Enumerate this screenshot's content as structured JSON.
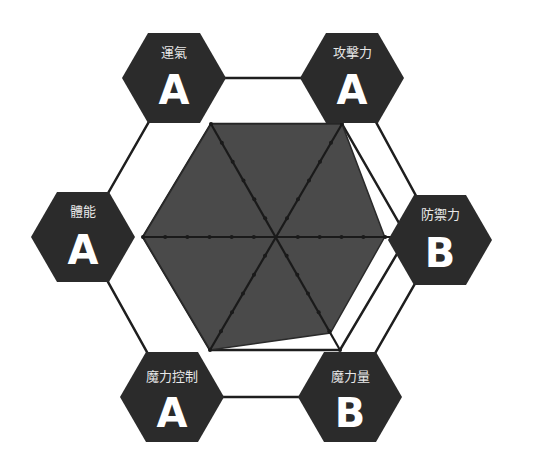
{
  "chart_data": {
    "type": "radar",
    "title": "",
    "axes": [
      "運氣",
      "攻擊力",
      "防禦力",
      "魔力量",
      "魔力控制",
      "體能"
    ],
    "grades": [
      "A",
      "A",
      "B",
      "B",
      "A",
      "A"
    ],
    "values": [
      100,
      100,
      83,
      85,
      100,
      100
    ],
    "scale": {
      "min": 0,
      "max": 100,
      "ticks_per_axis": 6
    },
    "grid": "hexagon",
    "legend": "none"
  },
  "colors": {
    "background": "#ffffff",
    "badge_fill": "#2b2b2b",
    "area_fill": "#4a4a4a",
    "line": "#1e1e1e",
    "badge_text": "#ffffff"
  },
  "badges": [
    {
      "label": "運氣",
      "grade": "A"
    },
    {
      "label": "攻擊力",
      "grade": "A"
    },
    {
      "label": "防禦力",
      "grade": "B"
    },
    {
      "label": "魔力量",
      "grade": "B"
    },
    {
      "label": "魔力控制",
      "grade": "A"
    },
    {
      "label": "體能",
      "grade": "A"
    }
  ]
}
